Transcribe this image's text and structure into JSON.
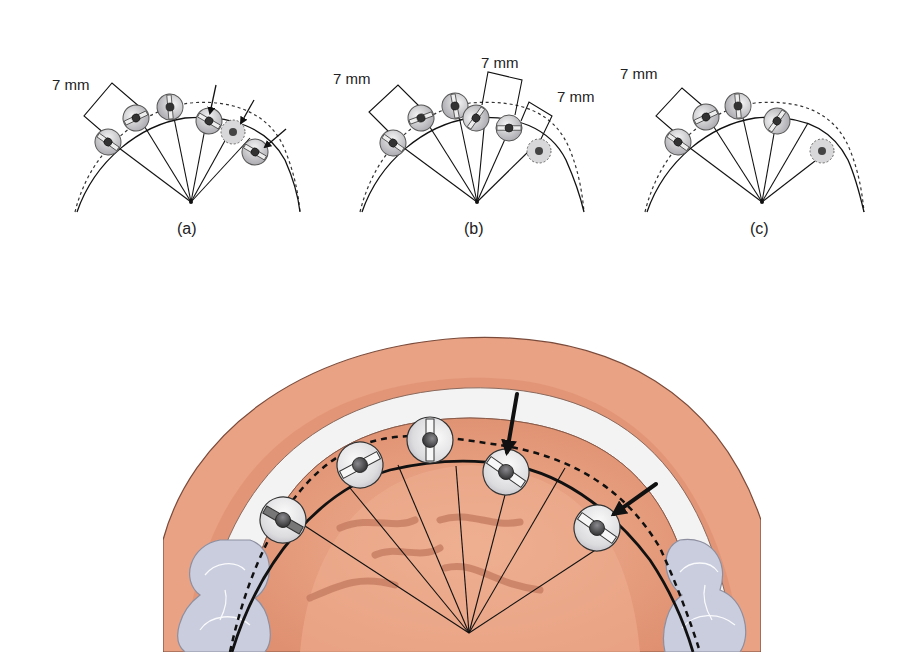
{
  "figure": {
    "panels": [
      {
        "id": "a",
        "label": "(a)",
        "measurements": [
          "7 mm"
        ],
        "screws": 6,
        "arrows": 3,
        "ghost_screws": 1
      },
      {
        "id": "b",
        "label": "(b)",
        "measurements": [
          "7 mm",
          "7 mm",
          "7 mm"
        ],
        "screws": 6,
        "arrows": 0,
        "ghost_screws": 1
      },
      {
        "id": "c",
        "label": "(c)",
        "measurements": [
          "7 mm"
        ],
        "screws": 5,
        "arrows": 0,
        "ghost_screws": 1
      }
    ],
    "illustration": {
      "subject": "maxillary arch with miniscrew implants",
      "screws": 5,
      "arrows": 2
    },
    "colors": {
      "gingiva": "#e9a284",
      "gingiva_shadow": "#d98a6c",
      "palate": "#e39676",
      "palate_center": "#eaa887",
      "rugae": "#c98166",
      "tooth": "#c9cdde",
      "tooth_outline": "#8d8fa0",
      "white_band": "#f4f3f3",
      "screw_face": "#e4e4e6",
      "screw_shade": "#bdbdc2",
      "screw_head": "#4a4a4e",
      "line": "#111111"
    }
  }
}
